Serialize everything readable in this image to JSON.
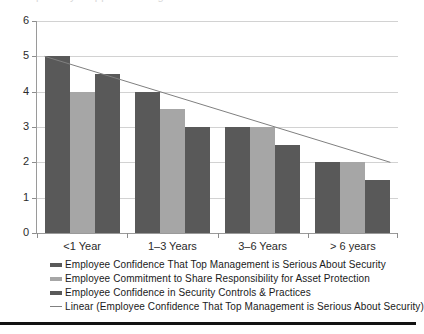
{
  "chart_data": {
    "type": "bar",
    "title": "",
    "xlabel": "",
    "ylabel": "",
    "ylim": [
      0,
      6
    ],
    "yticks": [
      0,
      1,
      2,
      3,
      4,
      5,
      6
    ],
    "grid": true,
    "legend_position": "bottom-left",
    "categories": [
      "<1 Year",
      "1–3 Years",
      "3–6 Years",
      "> 6 years"
    ],
    "series": [
      {
        "name": "Employee Confidence That Top Management is Serious About Security",
        "color": "#595959",
        "values": [
          5,
          4,
          3,
          2
        ]
      },
      {
        "name": "Employee Commitment to Share Responsibility for Asset Protection",
        "color": "#a6a6a6",
        "values": [
          4,
          3.5,
          3,
          2
        ]
      },
      {
        "name": "Employee Confidence in Security Controls & Practices",
        "color": "#595959",
        "values": [
          4.5,
          3,
          2.5,
          1.5
        ]
      }
    ],
    "trendline": {
      "name": "Linear (Employee Confidence That Top Management is Serious About Security)",
      "color": "#808080",
      "start_value": 5,
      "end_value": 2
    }
  },
  "legend": {
    "items": [
      {
        "label": "Employee Confidence That Top Management is Serious About Security",
        "marker": "bar",
        "color": "#595959"
      },
      {
        "label": "Employee Commitment to Share Responsibility for Asset Protection",
        "marker": "bar",
        "color": "#a6a6a6"
      },
      {
        "label": "Employee Confidence in Security Controls & Practices",
        "marker": "bar",
        "color": "#595959"
      },
      {
        "label": "Linear (Employee Confidence That Top Management is Serious About Security)",
        "marker": "line",
        "color": "#808080"
      }
    ]
  },
  "title_strip": {
    "ghost_text": "partially cropped heading text"
  }
}
